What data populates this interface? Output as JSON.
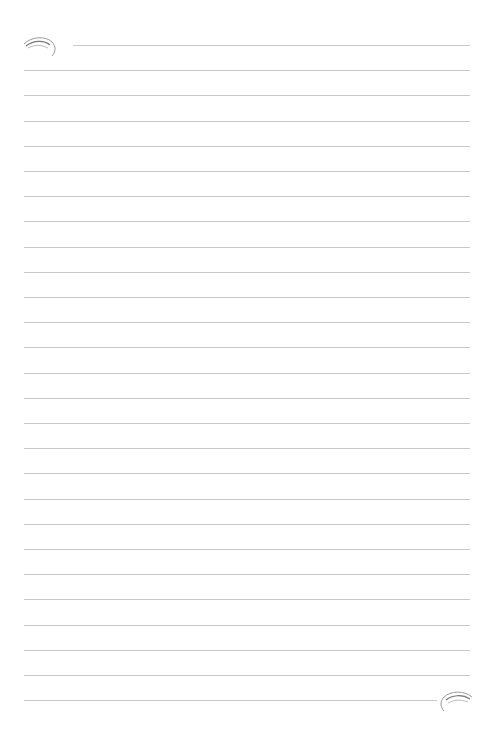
{
  "page": {
    "type": "lined-paper",
    "background_color": "#ffffff",
    "line_color": "#c9c9c9",
    "line_count": 27,
    "first_line_y": 45,
    "line_spacing": 25.2,
    "line_left": 24,
    "line_right": 470,
    "first_line_left": 73,
    "last_line_right": 437
  },
  "ornaments": {
    "top_left": "flourish-swirl",
    "bottom_right": "flourish-swirl"
  }
}
